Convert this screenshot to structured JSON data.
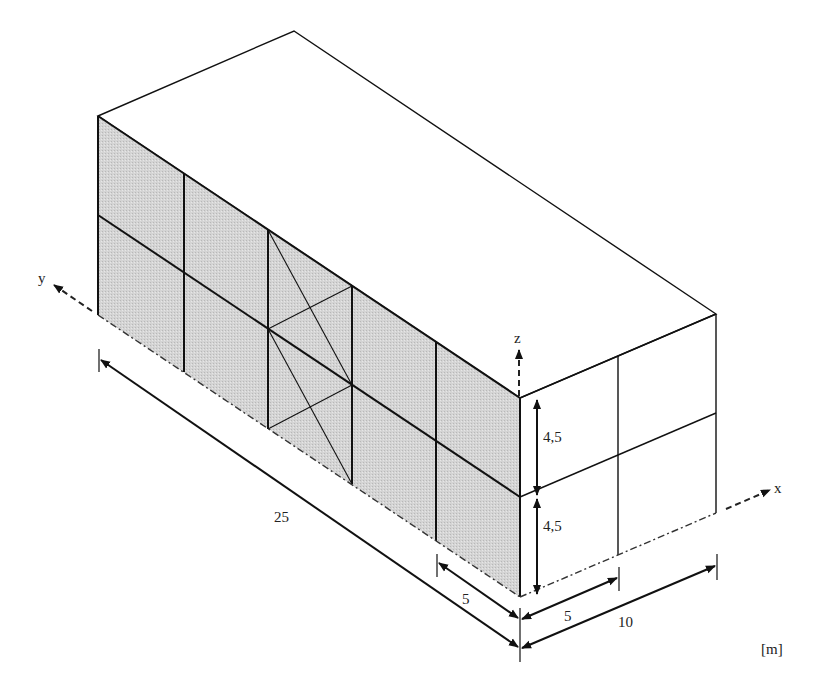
{
  "figure": {
    "type": "isometric building frame diagram",
    "unit_label": "[m]",
    "colors": {
      "line": "#111111",
      "braced_wall_fill": "#d2d2d2",
      "background": "#ffffff"
    }
  },
  "axes": {
    "x_label": "x",
    "y_label": "y",
    "z_label": "z"
  },
  "dimensions": {
    "length": "25",
    "bay_width": "5",
    "end_bay": "5",
    "width": "10",
    "story_height_upper": "4,5",
    "story_height_lower": "4,5"
  },
  "structure": {
    "length_bays": 5,
    "width_bays": 2,
    "stories": 2,
    "braced_bay_index": 3
  }
}
